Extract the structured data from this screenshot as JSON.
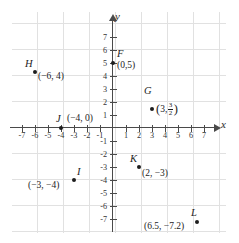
{
  "figure": {
    "type": "coordinate-plane",
    "axis_labels": {
      "x": "x",
      "y": "y"
    },
    "x_ticks": [
      -7,
      -6,
      -5,
      -4,
      -3,
      -2,
      -1,
      1,
      2,
      3,
      4,
      5,
      6,
      7
    ],
    "y_ticks": [
      7,
      6,
      5,
      4,
      3,
      2,
      1,
      -1,
      -2,
      -3,
      -4,
      -5,
      -6,
      -7
    ],
    "x_tick_labels": [
      "-7",
      "-6",
      "-5",
      "-4",
      "-3",
      "-2",
      "-1",
      "1",
      "2",
      "3",
      "4",
      "5",
      "6",
      "7"
    ],
    "y_tick_labels": [
      "7",
      "6",
      "5",
      "4",
      "3",
      "2",
      "1",
      "-1",
      "-2",
      "-3",
      "-4",
      "-5",
      "-6",
      "-7"
    ],
    "grid": true,
    "grid_color": "#dcdcdc",
    "axis_color": "#4a4a4a",
    "point_color": "#1d1d1d"
  },
  "chart_data": {
    "type": "scatter",
    "title": "",
    "xlabel": "x",
    "ylabel": "y",
    "xlim": [
      -7.8,
      7.8
    ],
    "ylim": [
      -8.1,
      7.8
    ],
    "grid": true,
    "points": [
      {
        "name": "F",
        "x": 0,
        "y": 5,
        "label": "(0,5)"
      },
      {
        "name": "G",
        "x": 3,
        "y": 1.5,
        "label": "(3, 3/2)",
        "coord_x": "3",
        "frac_num": "3",
        "frac_den": "2"
      },
      {
        "name": "H",
        "x": -6,
        "y": 4,
        "label": "(−6, 4)"
      },
      {
        "name": "I",
        "x": -3,
        "y": -4,
        "label": "(−3, −4)"
      },
      {
        "name": "J",
        "x": -4,
        "y": 0,
        "label": "(−4, 0)"
      },
      {
        "name": "K",
        "x": 2,
        "y": -3,
        "label": "(2, −3)"
      },
      {
        "name": "L",
        "x": 6.5,
        "y": -7.2,
        "label": "(6.5, −7.2)"
      }
    ]
  },
  "labels": {
    "F": {
      "name": "F",
      "coord": "(0,5)"
    },
    "G": {
      "name": "G",
      "open": "(",
      "x": "3,",
      "num": "3",
      "den": "2",
      "close": ")"
    },
    "H": {
      "name": "H",
      "coord": "(−6, 4)"
    },
    "I": {
      "name": "I",
      "coord": "(−3, −4)"
    },
    "J": {
      "name": "J",
      "coord": "(−4, 0)"
    },
    "K": {
      "name": "K",
      "coord": "(2, −3)"
    },
    "L": {
      "name": "L",
      "coord": "(6.5, −7.2)"
    }
  }
}
